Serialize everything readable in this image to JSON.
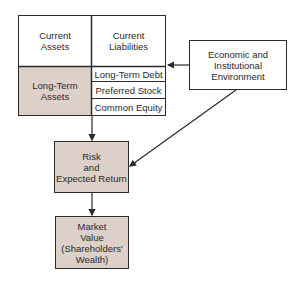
{
  "balance_sheet": {
    "current_assets": "Current\nAssets",
    "current_liabilities": "Current\nLiabilities",
    "long_term_assets": "Long-Term\nAssets",
    "long_term_debt": "Long-Term Debt",
    "preferred_stock": "Preferred Stock",
    "common_equity": "Common Equity"
  },
  "environment": "Economic and\nInstitutional\nEnvironment",
  "risk_return": "Risk\nand\nExpected Return",
  "market_value": "Market\nValue\n(Shareholders'\nWealth)",
  "colors": {
    "shaded_fill": "#dcd0c8",
    "line": "#2b2b2b"
  }
}
